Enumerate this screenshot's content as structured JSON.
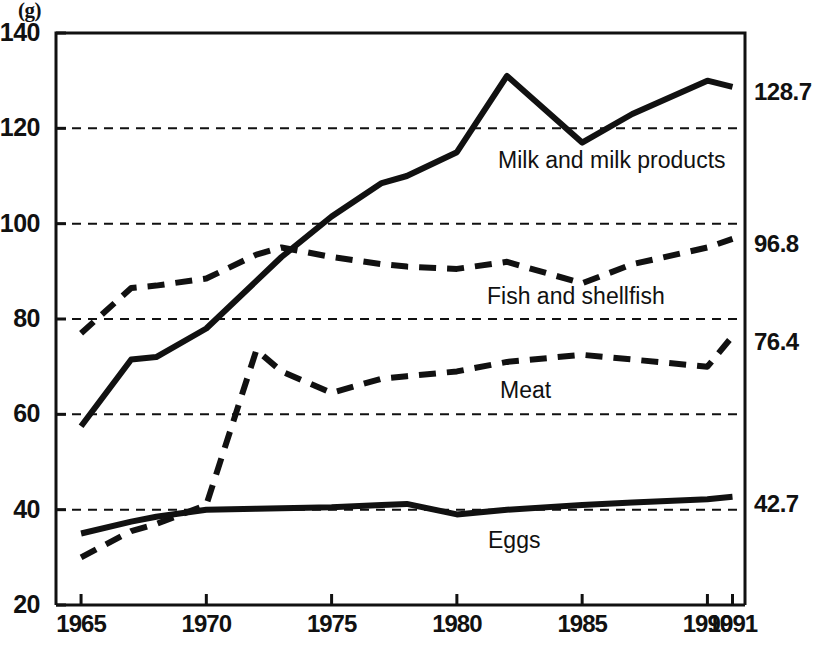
{
  "chart_data": {
    "type": "line",
    "title": "",
    "subtitle": "",
    "xlabel": "",
    "ylabel": "(g)",
    "unit_note": "(g)",
    "xlim": [
      1964,
      1991.5
    ],
    "ylim": [
      20,
      140
    ],
    "ytick_step": 20,
    "grid": "horizontal dashed at 40, 60, 80, 100, 120",
    "legend_position": "inline labels next to each line",
    "x_ticks": [
      "1965",
      "1970",
      "1975",
      "1980",
      "1985",
      "1990",
      "1991"
    ],
    "x_tick_values": [
      1965,
      1970,
      1975,
      1980,
      1985,
      1990,
      1991
    ],
    "y_ticks": [
      "20",
      "40",
      "60",
      "80",
      "100",
      "120",
      "140"
    ],
    "y_tick_values": [
      20,
      40,
      60,
      80,
      100,
      120,
      140
    ],
    "end_value_labels": [
      {
        "series": "Milk and milk products",
        "text": "128.7",
        "value": 128.7
      },
      {
        "series": "Fish and shellfish",
        "text": "96.8",
        "value": 96.8
      },
      {
        "series": "Meat",
        "text": "76.4",
        "value": 76.4
      },
      {
        "series": "Eggs",
        "text": "42.7",
        "value": 42.7
      }
    ],
    "series": [
      {
        "name": "Milk and milk products",
        "label": "Milk and milk products",
        "style": "solid",
        "color": "#111111",
        "x": [
          1965,
          1967,
          1968,
          1970,
          1972,
          1973,
          1975,
          1977,
          1978,
          1980,
          1982,
          1985,
          1987,
          1990,
          1991
        ],
        "values": [
          57.5,
          71.5,
          72.0,
          78.0,
          88.0,
          93.0,
          101.5,
          108.5,
          110.0,
          115.0,
          131.0,
          117.0,
          123.0,
          130.0,
          128.7
        ]
      },
      {
        "name": "Fish and shellfish",
        "label": "Fish and shellfish",
        "style": "dashed",
        "color": "#111111",
        "x": [
          1965,
          1967,
          1968,
          1970,
          1972,
          1973,
          1975,
          1977,
          1978,
          1980,
          1982,
          1985,
          1987,
          1990,
          1991
        ],
        "values": [
          77.0,
          86.5,
          87.0,
          88.5,
          93.5,
          95.0,
          93.0,
          91.5,
          91.0,
          90.5,
          92.0,
          87.5,
          91.5,
          95.0,
          96.8
        ]
      },
      {
        "name": "Meat",
        "label": "Meat",
        "style": "dashed",
        "color": "#111111",
        "x": [
          1965,
          1967,
          1968,
          1970,
          1972,
          1973,
          1975,
          1977,
          1978,
          1980,
          1982,
          1985,
          1987,
          1990,
          1991
        ],
        "values": [
          30.0,
          35.5,
          37.0,
          41.0,
          73.5,
          69.0,
          64.5,
          67.5,
          68.0,
          69.0,
          71.0,
          72.5,
          71.5,
          70.0,
          76.4
        ]
      },
      {
        "name": "Eggs",
        "label": "Eggs",
        "style": "solid",
        "color": "#111111",
        "x": [
          1965,
          1967,
          1968,
          1970,
          1972,
          1973,
          1975,
          1977,
          1978,
          1980,
          1982,
          1985,
          1987,
          1990,
          1991
        ],
        "values": [
          35.0,
          37.5,
          38.5,
          40.0,
          40.2,
          40.3,
          40.5,
          41.0,
          41.2,
          39.0,
          40.0,
          41.0,
          41.5,
          42.2,
          42.7
        ]
      }
    ]
  },
  "axis": {
    "unit": "(g)",
    "y_labels": [
      "140",
      "120",
      "100",
      "80",
      "60",
      "40",
      "20"
    ],
    "x_labels": [
      "1965",
      "1970",
      "1975",
      "1980",
      "1985",
      "1990",
      "1991"
    ]
  },
  "right_labels": {
    "milk": "128.7",
    "fish": "96.8",
    "meat": "76.4",
    "eggs": "42.7"
  },
  "series_labels": {
    "milk": "Milk and milk products",
    "fish": "Fish and shellfish",
    "meat": "Meat",
    "eggs": "Eggs"
  },
  "colors": {
    "ink": "#111111",
    "background": "#ffffff",
    "grid": "#111111"
  }
}
